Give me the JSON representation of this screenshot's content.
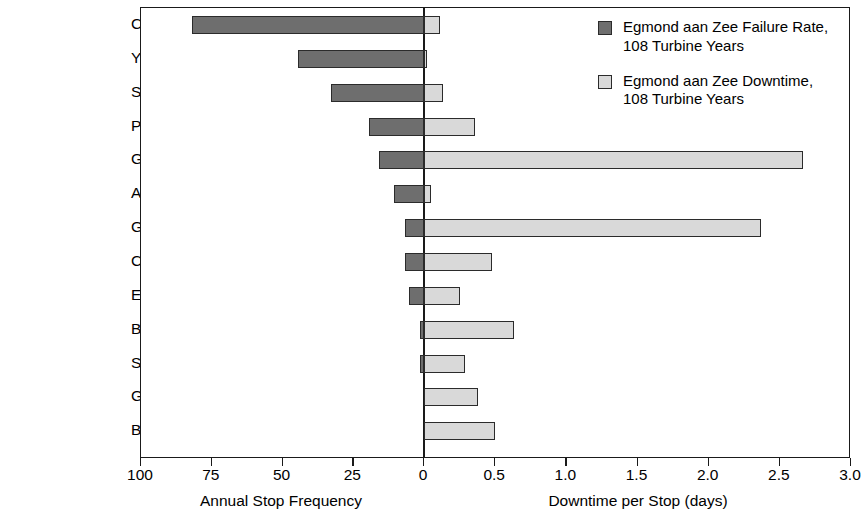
{
  "chart_data": {
    "type": "bar",
    "title": "",
    "orientation": "horizontal",
    "style": "back-to-back / tornado (diverging) bar chart",
    "categories": [
      "Control system",
      "Yaw system",
      "Schedule service",
      "Pitch system",
      "Gearbox",
      "Ambient",
      "Generator",
      "Converter",
      "Electrical",
      "Blade system",
      "Structure",
      "Grid",
      "Brake system"
    ],
    "series": [
      {
        "name": "Egmond aan Zee Failure Rate, 108 Turbine Years",
        "axis": "left",
        "direction": "left",
        "color": "#6e6e6e",
        "values": [
          82,
          44.5,
          33,
          19.5,
          16,
          10.5,
          6.7,
          6.7,
          5.3,
          1.5,
          1.5,
          0,
          0
        ]
      },
      {
        "name": "Egmond aan Zee Downtime, 108 Turbine Years",
        "axis": "right",
        "direction": "right",
        "color": "#d9d9d9",
        "values": [
          0.11,
          0.02,
          0.13,
          0.36,
          2.66,
          0.05,
          2.37,
          0.48,
          0.25,
          0.63,
          0.29,
          0.38,
          0.5
        ]
      }
    ],
    "left_axis": {
      "label": "Annual Stop Frequency",
      "ticks": [
        100,
        75,
        50,
        25,
        0
      ],
      "tick_labels": [
        "100",
        "75",
        "50",
        "25",
        "0"
      ],
      "range": [
        100,
        0
      ]
    },
    "right_axis": {
      "label": "Downtime per Stop (days)",
      "ticks": [
        0,
        0.5,
        1.0,
        1.5,
        2.0,
        2.5,
        3.0
      ],
      "tick_labels": [
        "0",
        "0.5",
        "1.0",
        "1.5",
        "2.0",
        "2.5",
        "3.0"
      ],
      "range": [
        0,
        3.0
      ]
    },
    "grid": false,
    "legend_position": "top-right"
  },
  "legend": {
    "items": [
      {
        "swatch": "dark",
        "label": "Egmond aan Zee Failure Rate,\n108 Turbine Years"
      },
      {
        "swatch": "light",
        "label": "Egmond aan Zee Downtime,\n108 Turbine Years"
      }
    ]
  }
}
